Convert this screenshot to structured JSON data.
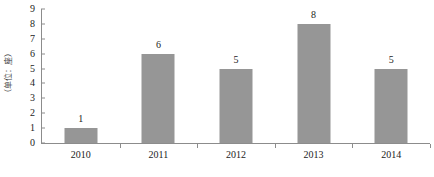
{
  "chart_data": {
    "type": "bar",
    "title": "",
    "subtitle": "",
    "xlabel": "",
    "ylabel": "（单位：座）",
    "categories": [
      "2010",
      "2011",
      "2012",
      "2013",
      "2014"
    ],
    "values": [
      1,
      6,
      5,
      8,
      5
    ],
    "data_labels": [
      "1",
      "6",
      "5",
      "8",
      "5"
    ],
    "ylim": [
      0,
      9
    ],
    "y_ticks": [
      "0",
      "1",
      "2",
      "3",
      "4",
      "5",
      "6",
      "7",
      "8",
      "9"
    ],
    "grid": false,
    "legend": null,
    "series": [
      {
        "name": "",
        "values": [
          1,
          6,
          5,
          8,
          5
        ],
        "color": "#969696"
      }
    ],
    "colors": {
      "bar_fill": "#969696",
      "axis_line": "#8c8c8c",
      "text": "#1c1c1c",
      "background": "#ffffff"
    }
  }
}
